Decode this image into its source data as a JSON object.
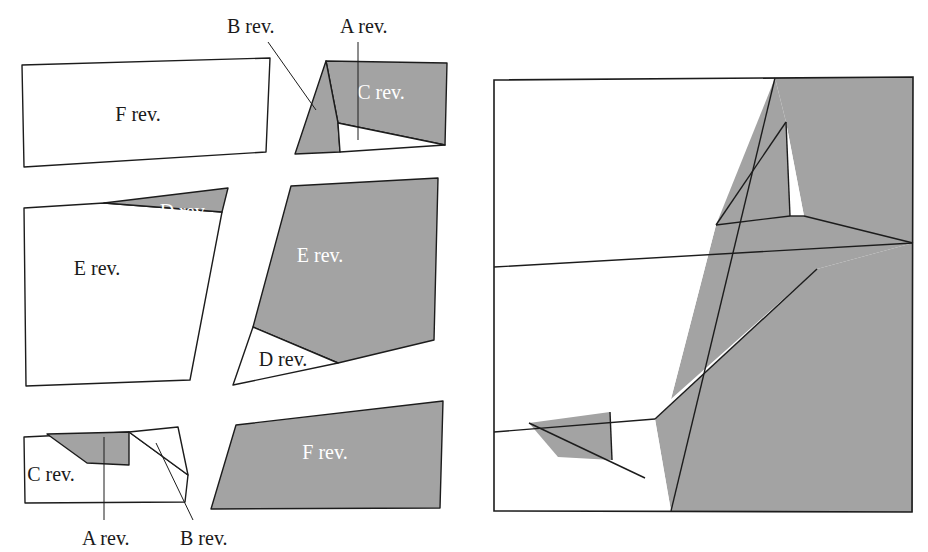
{
  "figure": {
    "colors": {
      "shaded_fill": "#a3a3a3",
      "plain_fill": "#ffffff",
      "stroke": "#1c1c1c",
      "background": "#ffffff",
      "label_light": "#ffffff",
      "label_dark": "#1a1a1a"
    },
    "panels": [
      {
        "id": "exploded",
        "name": "exploded-view"
      },
      {
        "id": "assembled",
        "name": "assembled-view"
      }
    ]
  },
  "labels": {
    "a_rev": "A rev.",
    "b_rev": "B rev.",
    "c_rev": "C rev.",
    "d_rev": "D rev.",
    "e_rev": "E rev.",
    "f_rev": "F rev."
  },
  "exploded": {
    "pieces": [
      {
        "name": "piece-f-top",
        "label": "F rev.",
        "shaded": false,
        "label_x": 138,
        "label_y": 121,
        "points": "22,65 270,58 266,152 24,167"
      },
      {
        "name": "piece-c-top",
        "label": "C rev.",
        "shaded": true,
        "label_x": 381,
        "label_y": 99,
        "points": "326,61 447,63 445,145 338,123"
      },
      {
        "name": "piece-b-top",
        "label": "",
        "shaded": true,
        "label_x": 0,
        "label_y": 0,
        "points": "326,61 338,123 340,152 295,154"
      },
      {
        "name": "piece-a-top",
        "label": "",
        "shaded": false,
        "label_x": 0,
        "label_y": 0,
        "points": "338,123 445,145 340,152"
      },
      {
        "name": "piece-e-mid-left",
        "label": "E rev.",
        "shaded": false,
        "label_x": 97,
        "label_y": 275,
        "points": "24,208 104,203 222,212 190,380 26,386"
      },
      {
        "name": "piece-d-mid-left",
        "label": "D rev.",
        "shaded": true,
        "label_x": 184,
        "label_y": 218,
        "points": "104,203 228,188 222,212"
      },
      {
        "name": "piece-e-mid-right",
        "label": "E rev.",
        "shaded": true,
        "label_x": 320,
        "label_y": 262,
        "points": "291,186 438,178 434,340 338,363 253,327"
      },
      {
        "name": "piece-d-mid-right",
        "label": "D rev.",
        "shaded": false,
        "label_x": 283,
        "label_y": 366,
        "points": "253,327 338,363 233,385"
      },
      {
        "name": "piece-f-bottom",
        "label": "F rev.",
        "shaded": true,
        "label_x": 325,
        "label_y": 459,
        "points": "236,425 443,401 440,508 211,509"
      },
      {
        "name": "piece-c-bottom",
        "label": "C rev.",
        "shaded": false,
        "label_x": 51,
        "label_y": 481,
        "points": "24,437 129,432 188,475 185,502 25,503"
      },
      {
        "name": "piece-b-bottom",
        "label": "",
        "shaded": false,
        "label_x": 0,
        "label_y": 0,
        "points": "129,432 178,427 188,475"
      },
      {
        "name": "piece-a-bottom",
        "label": "",
        "shaded": true,
        "label_x": 0,
        "label_y": 0,
        "points": "47,434 129,432 129,465 87,463"
      }
    ],
    "callouts": [
      {
        "name": "callout-b-top",
        "label": "B rev.",
        "text_x": 227,
        "text_y": 33,
        "x1": 268,
        "y1": 42,
        "x2": 316,
        "y2": 110
      },
      {
        "name": "callout-a-top",
        "label": "A rev.",
        "text_x": 340,
        "text_y": 33,
        "x1": 358,
        "y1": 42,
        "x2": 358,
        "y2": 140
      },
      {
        "name": "callout-a-bottom",
        "label": "A rev.",
        "text_x": 82,
        "text_y": 545,
        "x1": 104,
        "y1": 520,
        "x2": 104,
        "y2": 437
      },
      {
        "name": "callout-b-bottom",
        "label": "B rev.",
        "text_x": 180,
        "text_y": 545,
        "x1": 193,
        "y1": 520,
        "x2": 156,
        "y2": 443
      }
    ]
  },
  "assembled": {
    "frame": {
      "name": "assembled-frame",
      "points": "494,80 913,77 912,512 494,511"
    },
    "pieces": [
      {
        "name": "assembled-piece-f-top",
        "shaded": false,
        "points": "494,80 775,78 716,225 494,267"
      },
      {
        "name": "assembled-piece-c-top",
        "shaded": true,
        "points": "775,78 913,77 913,243 804,216 786,122"
      },
      {
        "name": "assembled-piece-b-top",
        "shaded": true,
        "points": "775,78 786,122 790,216 716,225"
      },
      {
        "name": "assembled-piece-a-top",
        "shaded": false,
        "points": "786,122 804,216 790,216"
      },
      {
        "name": "assembled-piece-e-left",
        "shaded": true,
        "points": "716,225 790,216 804,216 913,243 817,269 671,399"
      },
      {
        "name": "assembled-piece-d-mid",
        "shaded": false,
        "points": "494,267 716,225 671,399 494,432"
      },
      {
        "name": "assembled-piece-e-right",
        "shaded": true,
        "points": "913,243 913,512 671,511 655,419 817,269"
      },
      {
        "name": "assembled-piece-c-bot",
        "shaded": false,
        "points": "494,432 655,419 671,511 494,511"
      },
      {
        "name": "assembled-piece-a-bot",
        "shaded": true,
        "points": "529,423 610,412 612,460 558,457"
      },
      {
        "name": "assembled-piece-b-bot",
        "shaded": false,
        "points": "610,412 655,419 645,478 612,460"
      }
    ],
    "inner_lines": [
      {
        "name": "assembled-line-1",
        "x1": 494,
        "y1": 267,
        "x2": 913,
        "y2": 243
      },
      {
        "name": "assembled-line-2",
        "x1": 775,
        "y1": 78,
        "x2": 671,
        "y2": 511
      },
      {
        "name": "assembled-line-3",
        "x1": 786,
        "y1": 122,
        "x2": 716,
        "y2": 225
      },
      {
        "name": "assembled-line-4",
        "x1": 790,
        "y1": 216,
        "x2": 786,
        "y2": 122
      },
      {
        "name": "assembled-line-5",
        "x1": 790,
        "y1": 216,
        "x2": 804,
        "y2": 216
      },
      {
        "name": "assembled-line-6",
        "x1": 804,
        "y1": 216,
        "x2": 913,
        "y2": 243
      },
      {
        "name": "assembled-line-7",
        "x1": 716,
        "y1": 225,
        "x2": 790,
        "y2": 216
      },
      {
        "name": "assembled-line-8",
        "x1": 494,
        "y1": 432,
        "x2": 655,
        "y2": 419
      },
      {
        "name": "assembled-line-9",
        "x1": 529,
        "y1": 423,
        "x2": 645,
        "y2": 478
      },
      {
        "name": "assembled-line-10",
        "x1": 610,
        "y1": 412,
        "x2": 612,
        "y2": 460
      },
      {
        "name": "assembled-line-11",
        "x1": 817,
        "y1": 269,
        "x2": 655,
        "y2": 419
      }
    ]
  }
}
